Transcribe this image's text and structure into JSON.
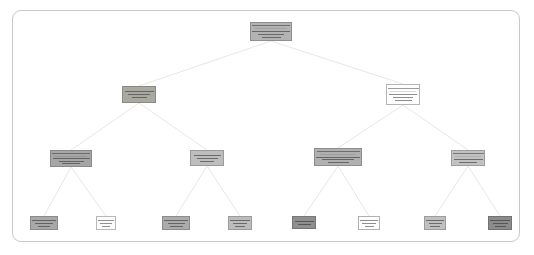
{
  "figure": {
    "kind": "decision-tree-diagram",
    "background": "#ffffff",
    "panel": {
      "border_color": "#c9c9c9",
      "fill": "#ffffff",
      "corner_radius_px": 9,
      "x": 12,
      "y": 10,
      "width": 508,
      "height": 232
    },
    "edge_color": "#e7e7e7",
    "depth_levels": 4,
    "node_count": 15,
    "legibility_note": "Node label text is rendered below 2px per glyph and is not resolvable in the source pixels; nodes are reproduced as shaded boxes with text-line glyphs."
  },
  "nodes": [
    {
      "id": "root",
      "level": 0,
      "x": 250,
      "y": 22,
      "w": 42,
      "h": 19,
      "fill": "#b3b3b3",
      "border": "#8f8f8f",
      "text_color": "#5a5a5a",
      "has_header": true,
      "lines": 3,
      "line_widths": [
        90,
        62,
        46
      ]
    },
    {
      "id": "n-l1-left",
      "level": 1,
      "x": 122,
      "y": 86,
      "w": 34,
      "h": 17,
      "fill": "#a9a9a2",
      "border": "#8a8a84",
      "text_color": "#5a5a5a",
      "has_header": false,
      "lines": 3,
      "line_widths": [
        84,
        64,
        44
      ]
    },
    {
      "id": "n-l1-right",
      "level": 1,
      "x": 386,
      "y": 84,
      "w": 34,
      "h": 21,
      "fill": "#fdfdfd",
      "border": "#b5b5b5",
      "text_color": "#7a7a7a",
      "has_header": true,
      "lines": 3,
      "line_widths": [
        82,
        58,
        50
      ]
    },
    {
      "id": "n-l2-a",
      "level": 2,
      "x": 50,
      "y": 150,
      "w": 42,
      "h": 17,
      "fill": "#a6a6a6",
      "border": "#8a8a8a",
      "text_color": "#585858",
      "has_header": true,
      "lines": 3,
      "line_widths": [
        88,
        60,
        42
      ]
    },
    {
      "id": "n-l2-b",
      "level": 2,
      "x": 190,
      "y": 150,
      "w": 34,
      "h": 16,
      "fill": "#bdbdbd",
      "border": "#9a9a9a",
      "text_color": "#5d5d5d",
      "has_header": false,
      "lines": 3,
      "line_widths": [
        80,
        62,
        40
      ]
    },
    {
      "id": "n-l2-c",
      "level": 2,
      "x": 314,
      "y": 148,
      "w": 48,
      "h": 18,
      "fill": "#b0b0b0",
      "border": "#8d8d8d",
      "text_color": "#585858",
      "has_header": true,
      "lines": 3,
      "line_widths": [
        92,
        66,
        44
      ]
    },
    {
      "id": "n-l2-d",
      "level": 2,
      "x": 451,
      "y": 150,
      "w": 34,
      "h": 16,
      "fill": "#c2c2c2",
      "border": "#9e9e9e",
      "text_color": "#5d5d5d",
      "has_header": true,
      "lines": 2,
      "line_widths": [
        84,
        54
      ]
    },
    {
      "id": "leaf-1",
      "level": 3,
      "x": 30,
      "y": 216,
      "w": 28,
      "h": 14,
      "fill": "#a8a8a8",
      "border": "#8b8b8b",
      "text_color": "#575757",
      "has_header": false,
      "lines": 3,
      "line_widths": [
        86,
        64,
        44
      ]
    },
    {
      "id": "leaf-2",
      "level": 3,
      "x": 96,
      "y": 216,
      "w": 20,
      "h": 14,
      "fill": "#fbfbfb",
      "border": "#b8b8b8",
      "text_color": "#7d7d7d",
      "has_header": false,
      "lines": 3,
      "line_widths": [
        78,
        60,
        42
      ]
    },
    {
      "id": "leaf-3",
      "level": 3,
      "x": 162,
      "y": 216,
      "w": 28,
      "h": 14,
      "fill": "#ababab",
      "border": "#8c8c8c",
      "text_color": "#575757",
      "has_header": false,
      "lines": 3,
      "line_widths": [
        86,
        62,
        46
      ]
    },
    {
      "id": "leaf-4",
      "level": 3,
      "x": 228,
      "y": 216,
      "w": 24,
      "h": 14,
      "fill": "#bcbcbc",
      "border": "#9a9a9a",
      "text_color": "#5c5c5c",
      "has_header": false,
      "lines": 3,
      "line_widths": [
        82,
        60,
        42
      ]
    },
    {
      "id": "leaf-5",
      "level": 3,
      "x": 292,
      "y": 216,
      "w": 24,
      "h": 13,
      "fill": "#8f8f8f",
      "border": "#767676",
      "text_color": "#4e4e4e",
      "has_header": false,
      "lines": 2,
      "line_widths": [
        80,
        56
      ]
    },
    {
      "id": "leaf-6",
      "level": 3,
      "x": 358,
      "y": 216,
      "w": 22,
      "h": 14,
      "fill": "#fdfdfd",
      "border": "#b0b0b0",
      "text_color": "#7a7a7a",
      "has_header": false,
      "lines": 3,
      "line_widths": [
        80,
        62,
        40
      ]
    },
    {
      "id": "leaf-7",
      "level": 3,
      "x": 424,
      "y": 216,
      "w": 22,
      "h": 14,
      "fill": "#c0c0c0",
      "border": "#9c9c9c",
      "text_color": "#5c5c5c",
      "has_header": false,
      "lines": 3,
      "line_widths": [
        82,
        60,
        44
      ]
    },
    {
      "id": "leaf-8",
      "level": 3,
      "x": 488,
      "y": 216,
      "w": 24,
      "h": 14,
      "fill": "#8b8b8b",
      "border": "#727272",
      "text_color": "#4c4c4c",
      "has_header": false,
      "lines": 3,
      "line_widths": [
        84,
        62,
        44
      ]
    }
  ],
  "edges": [
    {
      "from": "root",
      "to": "n-l1-left"
    },
    {
      "from": "root",
      "to": "n-l1-right"
    },
    {
      "from": "n-l1-left",
      "to": "n-l2-a"
    },
    {
      "from": "n-l1-left",
      "to": "n-l2-b"
    },
    {
      "from": "n-l1-right",
      "to": "n-l2-c"
    },
    {
      "from": "n-l1-right",
      "to": "n-l2-d"
    },
    {
      "from": "n-l2-a",
      "to": "leaf-1"
    },
    {
      "from": "n-l2-a",
      "to": "leaf-2"
    },
    {
      "from": "n-l2-b",
      "to": "leaf-3"
    },
    {
      "from": "n-l2-b",
      "to": "leaf-4"
    },
    {
      "from": "n-l2-c",
      "to": "leaf-5"
    },
    {
      "from": "n-l2-c",
      "to": "leaf-6"
    },
    {
      "from": "n-l2-d",
      "to": "leaf-7"
    },
    {
      "from": "n-l2-d",
      "to": "leaf-8"
    }
  ]
}
